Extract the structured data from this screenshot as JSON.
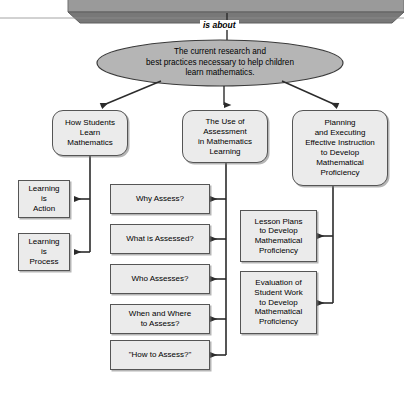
{
  "diagram": {
    "title_banner": {
      "shape": "3d-banner-clipped",
      "fill": "#9a9a9a",
      "edge": "#6e6e6e"
    },
    "edge_labels": {
      "is_about": "is about"
    },
    "central_concept": {
      "name": "central-ellipse",
      "text": "The current research and\nbest practices necessary to help children\nlearn mathematics.",
      "fill": "#b5b5b5",
      "stroke": "#3a3a3a"
    },
    "branches": [
      {
        "id": "how-students-learn",
        "text": "How Students\nLearn\nMathematics",
        "children": [
          {
            "id": "learning-is-action",
            "text": "Learning\nis\nAction"
          },
          {
            "id": "learning-is-process",
            "text": "Learning\nis\nProcess"
          }
        ]
      },
      {
        "id": "use-of-assessment",
        "text": "The Use of\nAssessment\nin Mathematics\nLearning",
        "children": [
          {
            "id": "why-assess",
            "text": "Why Assess?"
          },
          {
            "id": "what-is-assessed",
            "text": "What is Assessed?"
          },
          {
            "id": "who-assesses",
            "text": "Who Assesses?"
          },
          {
            "id": "when-and-where-to-assess",
            "text": "When and Where\nto Assess?"
          },
          {
            "id": "how-to-assess",
            "text": "\"How to Assess?\""
          }
        ]
      },
      {
        "id": "planning-and-executing",
        "text": "Planning\nand Executing\nEffective Instruction\nto Develop\nMathematical\nProficiency",
        "children": [
          {
            "id": "lesson-plans",
            "text": "Lesson Plans\nto Develop\nMathematical\nProficiency"
          },
          {
            "id": "evaluation-of-student-work",
            "text": "Evaluation of\nStudent Work\nto Develop\nMathematical\nProficiency"
          }
        ]
      }
    ],
    "colors": {
      "node_fill": "#ebebeb",
      "node_stroke": "#555555",
      "ellipse_fill": "#b5b5b5",
      "banner_fill": "#9a9a9a",
      "connector": "#2b2b2b",
      "background": "#ffffff"
    }
  }
}
